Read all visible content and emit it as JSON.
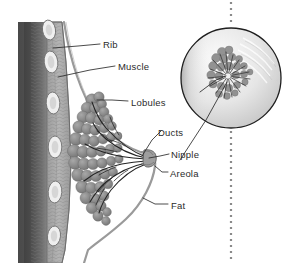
{
  "figure": {
    "background_color": "#ffffff",
    "ink_color": "#2b2b2b",
    "tissue_color": "#8e8e8e",
    "labels": [
      {
        "key": "rib",
        "text": "Rib"
      },
      {
        "key": "muscle",
        "text": "Muscle"
      },
      {
        "key": "lobules",
        "text": "Lobules"
      },
      {
        "key": "ducts",
        "text": "Ducts"
      },
      {
        "key": "nipple",
        "text": "Nipple"
      },
      {
        "key": "areola",
        "text": "Areola"
      },
      {
        "key": "fat",
        "text": "Fat"
      }
    ],
    "inset": {
      "name": "magnified-nipple-inset",
      "shape": "circle",
      "center_x": 231,
      "center_y": 78,
      "radius": 51
    },
    "divider": {
      "name": "dotted-divider",
      "orientation": "vertical",
      "x": 231,
      "style": "dotted"
    }
  }
}
